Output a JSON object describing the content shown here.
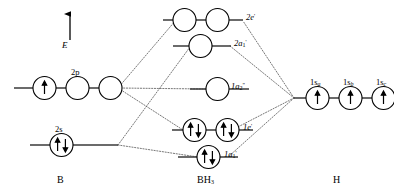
{
  "diagram": {
    "energy_axis_label": "E",
    "columns": [
      {
        "id": "left",
        "label": "B"
      },
      {
        "id": "center",
        "label": "BH3"
      },
      {
        "id": "right",
        "label": "H"
      }
    ],
    "colors": {
      "stroke": "#000000",
      "level_line": "#3a3a3a",
      "correlation_line": "#555555",
      "orbital_fill": "#ffffff",
      "text": "#000000"
    },
    "fragment_orbitals": {
      "boron": [
        {
          "id": "2p",
          "label": "2p",
          "label_main": "2p",
          "label_sub": "",
          "label_sup": "",
          "occupancy": [
            "up",
            "empty",
            "empty"
          ],
          "electron_count": 1
        },
        {
          "id": "2s",
          "label": "2s",
          "label_main": "2s",
          "label_sub": "",
          "label_sup": "",
          "occupancy": [
            "updown"
          ],
          "electron_count": 2
        }
      ],
      "hydrogen": [
        {
          "id": "1sa",
          "label": "1sa",
          "label_main": "1s",
          "label_sub": "a",
          "label_sup": "",
          "occupancy": [
            "up"
          ],
          "electron_count": 1
        },
        {
          "id": "1sb",
          "label": "1sb",
          "label_main": "1s",
          "label_sub": "b",
          "label_sup": "",
          "occupancy": [
            "up"
          ],
          "electron_count": 1
        },
        {
          "id": "1sc",
          "label": "1sc",
          "label_main": "1s",
          "label_sub": "c",
          "label_sup": "",
          "occupancy": [
            "up"
          ],
          "electron_count": 1
        }
      ]
    },
    "molecular_orbitals": [
      {
        "id": "2e",
        "label": "2e'",
        "label_main": "2e",
        "label_sub": "",
        "label_sup": "'",
        "degeneracy": 2,
        "occupancy": [
          "empty",
          "empty"
        ],
        "electron_count": 0,
        "character": "antibonding"
      },
      {
        "id": "2a1",
        "label": "2a1'",
        "label_main": "2a",
        "label_sub": "1",
        "label_sup": "'",
        "degeneracy": 1,
        "occupancy": [
          "empty"
        ],
        "electron_count": 0,
        "character": "antibonding"
      },
      {
        "id": "1a2",
        "label": "1a2\"",
        "label_main": "1a",
        "label_sub": "2",
        "label_sup": "\"",
        "degeneracy": 1,
        "occupancy": [
          "empty"
        ],
        "electron_count": 0,
        "character": "nonbonding"
      },
      {
        "id": "1e",
        "label": "1e'",
        "label_main": "1e",
        "label_sub": "",
        "label_sup": "'",
        "degeneracy": 2,
        "occupancy": [
          "updown",
          "updown"
        ],
        "electron_count": 4,
        "character": "bonding"
      },
      {
        "id": "1a1",
        "label": "1a1'",
        "label_main": "1a",
        "label_sub": "1",
        "label_sup": "'",
        "degeneracy": 1,
        "occupancy": [
          "updown"
        ],
        "electron_count": 2,
        "character": "bonding"
      }
    ]
  }
}
